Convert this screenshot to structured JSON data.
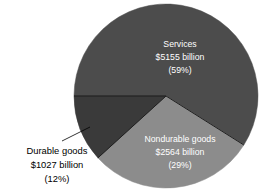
{
  "chart_data": {
    "type": "pie",
    "title": "",
    "subtitle": "",
    "xlabel": "",
    "ylabel": "",
    "legend_position": "none",
    "grid": false,
    "units": "billion dollars",
    "categories": [
      "Services",
      "Nondurable goods",
      "Durable goods"
    ],
    "values": [
      5155,
      2564,
      1027
    ],
    "percentages": [
      59,
      29,
      12
    ],
    "slices": [
      {
        "name": "Services",
        "label": "Services",
        "value": 5155,
        "value_label": "$5155 billion",
        "percent": 59,
        "percent_label": "(59%)",
        "color": "#4c4c4c",
        "label_color": "#ffffff",
        "label_placement": "inside",
        "start_angle": 180,
        "end_angle": 392.4
      },
      {
        "name": "Nondurable goods",
        "label": "Nondurable goods",
        "value": 2564,
        "value_label": "$2564 billion",
        "percent": 29,
        "percent_label": "(29%)",
        "color": "#8c8c8c",
        "label_color": "#ffffff",
        "label_placement": "inside",
        "start_angle": 32.4,
        "end_angle": 136.8
      },
      {
        "name": "Durable goods",
        "label": "Durable goods",
        "value": 1027,
        "value_label": "$1027 billion",
        "percent": 12,
        "percent_label": "(12%)",
        "color": "#3a3a3a",
        "label_color": "#000000",
        "label_placement": "outside-left",
        "start_angle": 136.8,
        "end_angle": 180
      }
    ]
  },
  "labels": {
    "services": {
      "line1": "Services",
      "line2": "$5155 billion",
      "line3": "(59%)"
    },
    "nondurable": {
      "line1": "Nondurable goods",
      "line2": "$2564 billion",
      "line3": "(29%)"
    },
    "durable": {
      "line1": "Durable goods",
      "line2": "$1027 billion",
      "line3": "(12%)"
    }
  },
  "colors": {
    "services": "#4c4c4c",
    "nondurable": "#8c8c8c",
    "durable": "#3a3a3a",
    "background": "#ffffff",
    "outline": "#2a2a2a",
    "leader_line": "#000000"
  }
}
